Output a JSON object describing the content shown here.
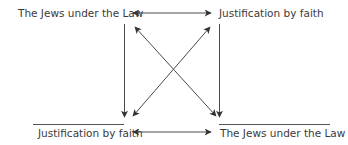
{
  "diagram": {
    "top_left": "The Jews under the Law",
    "top_right": "Justification by faith",
    "bottom_left": "Justification by faith",
    "bottom_right": "The Jews under the Law"
  },
  "colors": {
    "line": "#4a4a4a",
    "text": "#3a3a3a"
  }
}
